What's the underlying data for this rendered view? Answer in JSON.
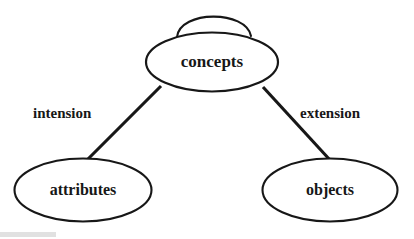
{
  "diagram": {
    "background_color": "#ffffff",
    "stroke_color": "#171717",
    "nodes": [
      {
        "id": "concepts",
        "label": "concepts",
        "cx": 212,
        "cy": 62,
        "rx": 66,
        "ry": 29.5,
        "stroke_width": 2.2,
        "font_size": 17,
        "self_loop": true
      },
      {
        "id": "attributes",
        "label": "attributes",
        "cx": 83,
        "cy": 190,
        "rx": 68.5,
        "ry": 31.5,
        "stroke_width": 2.1,
        "font_size": 16,
        "self_loop": false
      },
      {
        "id": "objects",
        "label": "objects",
        "cx": 330,
        "cy": 190,
        "rx": 67.5,
        "ry": 31.5,
        "stroke_width": 2.1,
        "font_size": 16,
        "self_loop": false
      }
    ],
    "edges": [
      {
        "id": "intension",
        "label": "intension",
        "from": "concepts",
        "to": "attributes",
        "x1": 161,
        "y1": 86,
        "x2": 86,
        "y2": 161,
        "label_x": 33,
        "label_y": 115,
        "font_size": 15
      },
      {
        "id": "extension",
        "label": "extension",
        "from": "concepts",
        "to": "objects",
        "x1": 263,
        "y1": 87,
        "x2": 330,
        "y2": 160,
        "label_x": 300,
        "label_y": 115,
        "font_size": 15
      }
    ],
    "self_loop": {
      "node": "concepts",
      "label": "",
      "path": "M 177 37 C 180 10 246 10 251 36",
      "stroke_width": 2.1
    }
  }
}
